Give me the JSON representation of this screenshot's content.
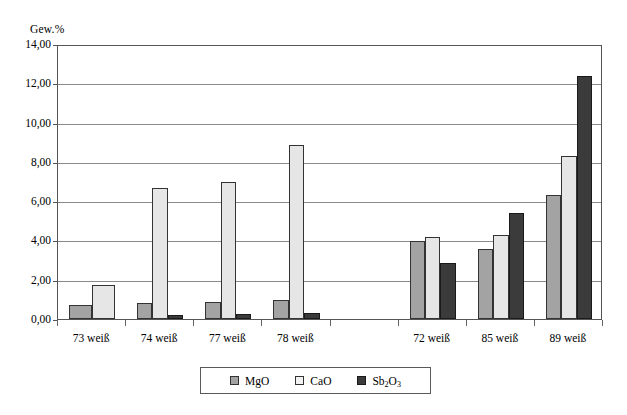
{
  "chart_data": {
    "type": "bar",
    "title": "",
    "ylabel": "Gew.%",
    "xlabel": "",
    "ylim": [
      0,
      14
    ],
    "ytick_step": 2,
    "ytick_labels": [
      "0,00",
      "2,00",
      "4,00",
      "6,00",
      "8,00",
      "10,00",
      "12,00",
      "14,00"
    ],
    "grid": true,
    "legend_position": "bottom",
    "categories": [
      "73 weiß",
      "74 weiß",
      "77 weiß",
      "78 weiß",
      "",
      "72 weiß",
      "85 weiß",
      "89 weiß"
    ],
    "series": [
      {
        "name": "MgO",
        "color": "#a3a3a3",
        "values": [
          0.7,
          0.8,
          0.85,
          0.95,
          null,
          3.95,
          3.55,
          6.3
        ]
      },
      {
        "name": "CaO",
        "color": "#e6e6e6",
        "values": [
          1.75,
          6.65,
          7.0,
          8.85,
          null,
          4.2,
          4.3,
          8.3
        ]
      },
      {
        "name": "Sb2O3",
        "label_html": "Sb<sub>2</sub>O<sub>3</sub>",
        "color": "#3b3b3b",
        "values": [
          null,
          0.2,
          0.25,
          0.3,
          null,
          2.85,
          5.4,
          12.35
        ]
      }
    ]
  },
  "legend": {
    "items": [
      {
        "label": "MgO",
        "key": "s-mgo"
      },
      {
        "label": "CaO",
        "key": "s-cao"
      },
      {
        "label": "Sb2O3",
        "key": "s-sb2o3"
      }
    ]
  }
}
